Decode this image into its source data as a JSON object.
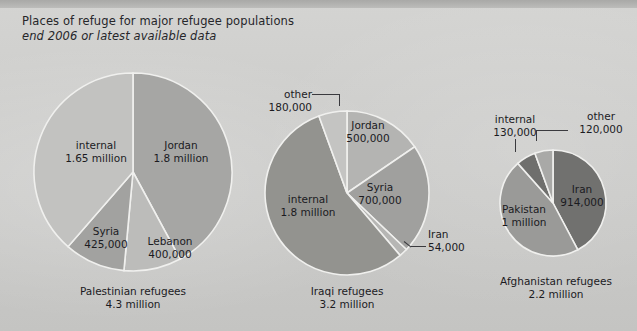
{
  "header": {
    "title": "Places of refuge for major refugee populations",
    "subtitle": "end 2006 or latest available data"
  },
  "colors": {
    "background": "#cfcfcd",
    "top_band": "#b0b0ae",
    "text": "#1b1b1f",
    "stroke": "#f0f0ee",
    "light_gray": "#c0c0be",
    "mid_light_gray": "#b2b2b0",
    "mid_gray": "#a0a09e",
    "dark_gray": "#8a8a88",
    "darker_gray": "#6e6e6c"
  },
  "chart_data": {
    "type": "pie",
    "title": "Places of refuge for major refugee populations",
    "subtitle": "end 2006 or latest available data",
    "legend": "none",
    "grid": false,
    "charts": [
      {
        "id": "palestinian",
        "caption_line1": "Palestinian refugees",
        "caption_line2": "4.3 million",
        "total": "4.3 million",
        "slices": [
          {
            "label": "Jordan",
            "value_text": "1.8 million",
            "value": 1800000,
            "color": "#a6a6a4"
          },
          {
            "label": "Lebanon",
            "value_text": "400,000",
            "value": 400000,
            "color": "#bcbcba"
          },
          {
            "label": "Syria",
            "value_text": "425,000",
            "value": 425000,
            "color": "#a2a2a0"
          },
          {
            "label": "internal",
            "value_text": "1.65 million",
            "value": 1650000,
            "color": "#c2c2c0"
          }
        ]
      },
      {
        "id": "iraqi",
        "caption_line1": "Iraqi refugees",
        "caption_line2": "3.2 million",
        "total": "3.2 million",
        "slices": [
          {
            "label": "Jordan",
            "value_text": "500,000",
            "value": 500000,
            "color": "#b4b4b2"
          },
          {
            "label": "Syria",
            "value_text": "700,000",
            "value": 700000,
            "color": "#a0a09e"
          },
          {
            "label": "Iran",
            "value_text": "54,000",
            "value": 54000,
            "color": "#b6b6b4"
          },
          {
            "label": "internal",
            "value_text": "1.8 million",
            "value": 1800000,
            "color": "#93938f"
          },
          {
            "label": "other",
            "value_text": "180,000",
            "value": 180000,
            "color": "#c4c4c2"
          }
        ]
      },
      {
        "id": "afghanistan",
        "caption_line1": "Afghanistan refugees",
        "caption_line2": "2.2 million",
        "total": "2.2 million",
        "slices": [
          {
            "label": "Iran",
            "value_text": "914,000",
            "value": 914000,
            "color": "#71716f"
          },
          {
            "label": "Pakistan",
            "value_text": "1 million",
            "value": 1000000,
            "color": "#9a9a98"
          },
          {
            "label": "internal",
            "value_text": "130,000",
            "value": 130000,
            "color": "#6f6f6d"
          },
          {
            "label": "other",
            "value_text": "120,000",
            "value": 120000,
            "color": "#a9a9a7"
          }
        ]
      }
    ]
  }
}
